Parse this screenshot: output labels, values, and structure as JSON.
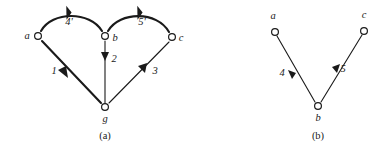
{
  "figure": {
    "background_color": "#ffffff",
    "ink_color": "#1a1a1a",
    "panels": [
      {
        "id": "panel-a",
        "caption": "(a)",
        "nodes": [
          {
            "id": "a",
            "label": "a",
            "x": 38,
            "y": 36,
            "label_x": 27,
            "label_y": 39
          },
          {
            "id": "b",
            "label": "b",
            "x": 105,
            "y": 36,
            "label_x": 115,
            "label_y": 41
          },
          {
            "id": "c",
            "label": "c",
            "x": 172,
            "y": 37,
            "label_x": 181,
            "label_y": 41
          },
          {
            "id": "g",
            "label": "g",
            "x": 105,
            "y": 107,
            "label_x": 105,
            "label_y": 122
          }
        ],
        "edges": [
          {
            "id": "a-b-arc",
            "from": "a",
            "to": "b",
            "label": "4'",
            "label_x": 69,
            "label_y": 25,
            "style": "thick-arc"
          },
          {
            "id": "b-c-arc",
            "from": "b",
            "to": "c",
            "label": "5'",
            "label_x": 142,
            "label_y": 25,
            "style": "thick-arc"
          },
          {
            "id": "a-g",
            "from": "a",
            "to": "g",
            "label": "1",
            "label_x": 54,
            "label_y": 74,
            "style": "thick-line"
          },
          {
            "id": "b-g",
            "from": "b",
            "to": "g",
            "label": "2",
            "label_x": 114,
            "label_y": 62,
            "style": "thin-line"
          },
          {
            "id": "g-c",
            "from": "g",
            "to": "c",
            "label": "3",
            "label_x": 155,
            "label_y": 74,
            "style": "thin-line"
          }
        ]
      },
      {
        "id": "panel-b",
        "caption": "(b)",
        "nodes": [
          {
            "id": "a",
            "label": "a",
            "x": 275,
            "y": 32,
            "label_x": 273,
            "label_y": 19
          },
          {
            "id": "c",
            "label": "c",
            "x": 364,
            "y": 31,
            "label_x": 364,
            "label_y": 18
          },
          {
            "id": "b",
            "label": "b",
            "x": 318,
            "y": 106,
            "label_x": 318,
            "label_y": 121
          }
        ],
        "edges": [
          {
            "id": "a-b",
            "from": "a",
            "to": "b",
            "label": "4",
            "label_x": 282,
            "label_y": 76,
            "style": "thin-line"
          },
          {
            "id": "b-c",
            "from": "b",
            "to": "c",
            "label": "5",
            "label_x": 343,
            "label_y": 72,
            "style": "thin-line"
          }
        ]
      }
    ]
  }
}
